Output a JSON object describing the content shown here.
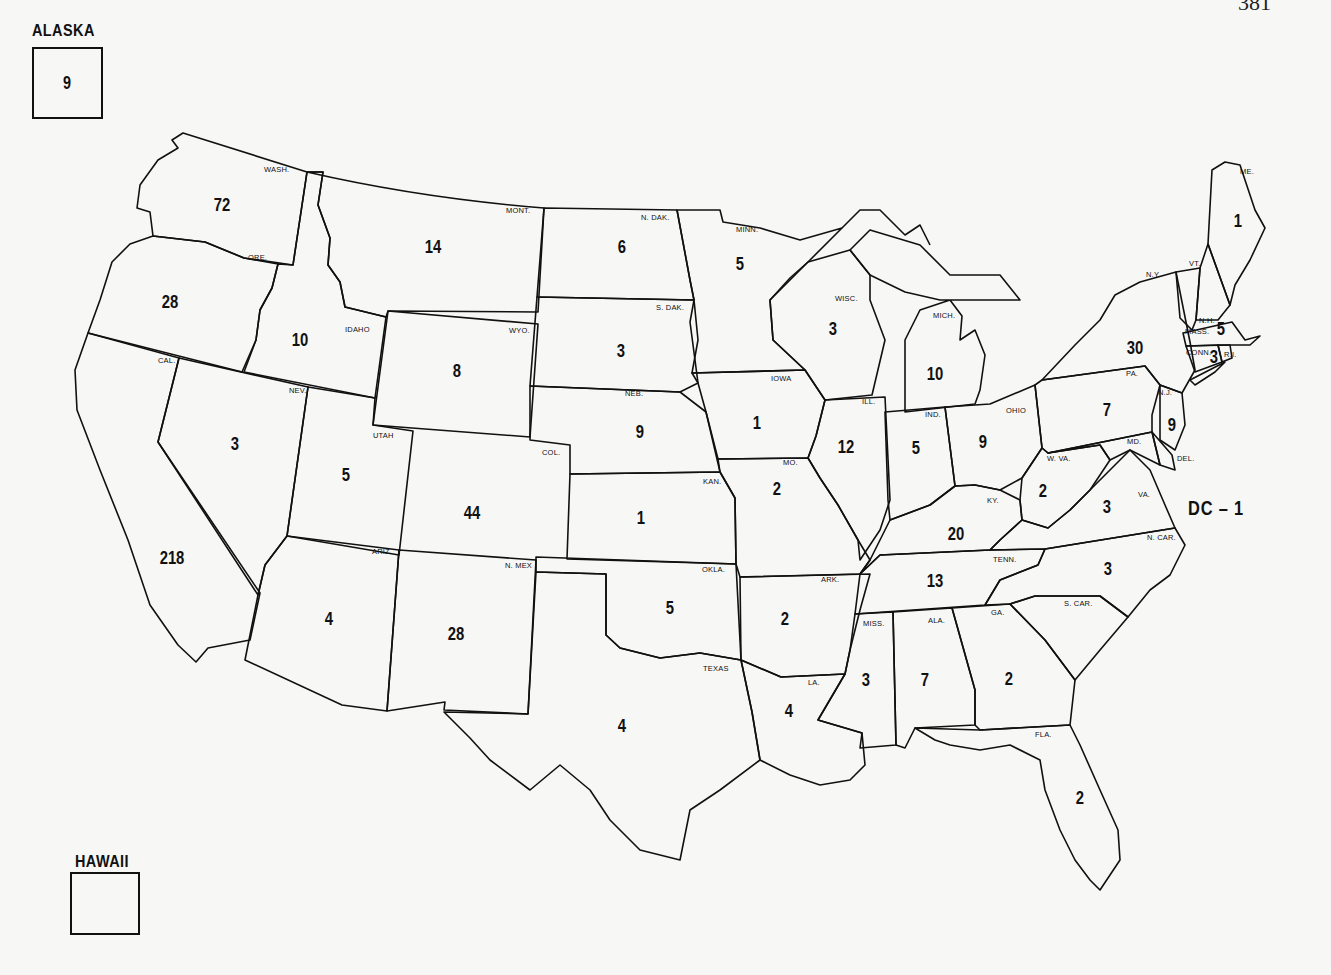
{
  "page": {
    "number": "381"
  },
  "insets": {
    "alaska": {
      "title": "ALASKA",
      "value": "9"
    },
    "hawaii": {
      "title": "HAWAII",
      "value": ""
    }
  },
  "dc": {
    "label": "DC – 1",
    "value": 1
  },
  "states": [
    {
      "abbr": "WASH.",
      "name": "Washington",
      "count": "72",
      "lx": 264,
      "ly": 166,
      "cx": 222,
      "cy": 204
    },
    {
      "abbr": "ORE.",
      "name": "Oregon",
      "count": "28",
      "lx": 248,
      "ly": 254,
      "cx": 170,
      "cy": 301
    },
    {
      "abbr": "CAL.",
      "name": "California",
      "count": "218",
      "lx": 158,
      "ly": 357,
      "cx": 172,
      "cy": 557
    },
    {
      "abbr": "IDAHO",
      "name": "Idaho",
      "count": "10",
      "lx": 345,
      "ly": 326,
      "cx": 300,
      "cy": 339
    },
    {
      "abbr": "NEV.",
      "name": "Nevada",
      "count": "3",
      "lx": 289,
      "ly": 387,
      "cx": 235,
      "cy": 443
    },
    {
      "abbr": "MONT.",
      "name": "Montana",
      "count": "14",
      "lx": 506,
      "ly": 207,
      "cx": 433,
      "cy": 246
    },
    {
      "abbr": "WYO.",
      "name": "Wyoming",
      "count": "8",
      "lx": 509,
      "ly": 327,
      "cx": 457,
      "cy": 370
    },
    {
      "abbr": "UTAH",
      "name": "Utah",
      "count": "5",
      "lx": 373,
      "ly": 432,
      "cx": 346,
      "cy": 474
    },
    {
      "abbr": "COL.",
      "name": "Colorado",
      "count": "44",
      "lx": 542,
      "ly": 449,
      "cx": 472,
      "cy": 512
    },
    {
      "abbr": "ARIZ.",
      "name": "Arizona",
      "count": "4",
      "lx": 372,
      "ly": 548,
      "cx": 329,
      "cy": 618
    },
    {
      "abbr": "N. MEX",
      "name": "New Mexico",
      "count": "28",
      "lx": 505,
      "ly": 562,
      "cx": 456,
      "cy": 633
    },
    {
      "abbr": "N. DAK.",
      "name": "North Dakota",
      "count": "6",
      "lx": 641,
      "ly": 214,
      "cx": 622,
      "cy": 246
    },
    {
      "abbr": "S. DAK.",
      "name": "South Dakota",
      "count": "3",
      "lx": 656,
      "ly": 304,
      "cx": 621,
      "cy": 350
    },
    {
      "abbr": "NEB.",
      "name": "Nebraska",
      "count": "9",
      "lx": 625,
      "ly": 390,
      "cx": 640,
      "cy": 431
    },
    {
      "abbr": "KAN.",
      "name": "Kansas",
      "count": "1",
      "lx": 703,
      "ly": 478,
      "cx": 641,
      "cy": 517
    },
    {
      "abbr": "OKLA.",
      "name": "Oklahoma",
      "count": "5",
      "lx": 702,
      "ly": 566,
      "cx": 670,
      "cy": 607
    },
    {
      "abbr": "TEXAS",
      "name": "Texas",
      "count": "4",
      "lx": 703,
      "ly": 665,
      "cx": 622,
      "cy": 725
    },
    {
      "abbr": "MINN.",
      "name": "Minnesota",
      "count": "5",
      "lx": 736,
      "ly": 226,
      "cx": 740,
      "cy": 263
    },
    {
      "abbr": "IOWA",
      "name": "Iowa",
      "count": "1",
      "lx": 771,
      "ly": 375,
      "cx": 757,
      "cy": 422
    },
    {
      "abbr": "MO.",
      "name": "Missouri",
      "count": "2",
      "lx": 783,
      "ly": 459,
      "cx": 777,
      "cy": 488
    },
    {
      "abbr": "ARK.",
      "name": "Arkansas",
      "count": "2",
      "lx": 821,
      "ly": 576,
      "cx": 785,
      "cy": 618
    },
    {
      "abbr": "LA.",
      "name": "Louisiana",
      "count": "4",
      "lx": 808,
      "ly": 679,
      "cx": 789,
      "cy": 710
    },
    {
      "abbr": "WISC.",
      "name": "Wisconsin",
      "count": "3",
      "lx": 835,
      "ly": 295,
      "cx": 833,
      "cy": 328
    },
    {
      "abbr": "ILL.",
      "name": "Illinois",
      "count": "12",
      "lx": 862,
      "ly": 398,
      "cx": 846,
      "cy": 446
    },
    {
      "abbr": "MICH.",
      "name": "Michigan",
      "count": "10",
      "lx": 933,
      "ly": 312,
      "cx": 935,
      "cy": 373
    },
    {
      "abbr": "IND.",
      "name": "Indiana",
      "count": "5",
      "lx": 925,
      "ly": 411,
      "cx": 916,
      "cy": 447
    },
    {
      "abbr": "OHIO",
      "name": "Ohio",
      "count": "9",
      "lx": 1006,
      "ly": 407,
      "cx": 983,
      "cy": 441
    },
    {
      "abbr": "KY.",
      "name": "Kentucky",
      "count": "20",
      "lx": 987,
      "ly": 497,
      "cx": 956,
      "cy": 533
    },
    {
      "abbr": "TENN.",
      "name": "Tennessee",
      "count": "13",
      "lx": 993,
      "ly": 556,
      "cx": 935,
      "cy": 580
    },
    {
      "abbr": "MISS.",
      "name": "Mississippi",
      "count": "3",
      "lx": 863,
      "ly": 620,
      "cx": 866,
      "cy": 679
    },
    {
      "abbr": "ALA.",
      "name": "Alabama",
      "count": "7",
      "lx": 928,
      "ly": 617,
      "cx": 925,
      "cy": 679
    },
    {
      "abbr": "GA.",
      "name": "Georgia",
      "count": "2",
      "lx": 991,
      "ly": 609,
      "cx": 1009,
      "cy": 678
    },
    {
      "abbr": "FLA.",
      "name": "Florida",
      "count": "2",
      "lx": 1035,
      "ly": 731,
      "cx": 1080,
      "cy": 797
    },
    {
      "abbr": "S. CAR.",
      "name": "South Carolina",
      "count": "",
      "lx": 1064,
      "ly": 600,
      "cx": null,
      "cy": null
    },
    {
      "abbr": "N. CAR.",
      "name": "North Carolina",
      "count": "3",
      "lx": 1147,
      "ly": 534,
      "cx": 1108,
      "cy": 568
    },
    {
      "abbr": "VA.",
      "name": "Virginia",
      "count": "3",
      "lx": 1138,
      "ly": 491,
      "cx": 1107,
      "cy": 506
    },
    {
      "abbr": "W. VA.",
      "name": "West Virginia",
      "count": "2",
      "lx": 1047,
      "ly": 455,
      "cx": 1043,
      "cy": 490
    },
    {
      "abbr": "MD.",
      "name": "Maryland",
      "count": "",
      "lx": 1127,
      "ly": 438,
      "cx": null,
      "cy": null
    },
    {
      "abbr": "DEL.",
      "name": "Delaware",
      "count": "",
      "lx": 1177,
      "ly": 455,
      "cx": null,
      "cy": null
    },
    {
      "abbr": "PA.",
      "name": "Pennsylvania",
      "count": "7",
      "lx": 1126,
      "ly": 370,
      "cx": 1107,
      "cy": 409
    },
    {
      "abbr": "N.J.",
      "name": "New Jersey",
      "count": "9",
      "lx": 1158,
      "ly": 389,
      "cx": 1172,
      "cy": 424
    },
    {
      "abbr": "N.Y.",
      "name": "New York",
      "count": "30",
      "lx": 1146,
      "ly": 271,
      "cx": 1135,
      "cy": 347
    },
    {
      "abbr": "VT.",
      "name": "Vermont",
      "count": "",
      "lx": 1189,
      "ly": 260,
      "cx": null,
      "cy": null
    },
    {
      "abbr": "N.H.",
      "name": "New Hampshire",
      "count": "",
      "lx": 1199,
      "ly": 317,
      "cx": null,
      "cy": null
    },
    {
      "abbr": "MASS.",
      "name": "Massachusetts",
      "count": "5",
      "lx": 1185,
      "ly": 328,
      "cx": 1221,
      "cy": 328
    },
    {
      "abbr": "CONN.",
      "name": "Connecticut",
      "count": "3",
      "lx": 1186,
      "ly": 349,
      "cx": 1214,
      "cy": 356
    },
    {
      "abbr": "R.I.",
      "name": "Rhode Island",
      "count": "",
      "lx": 1224,
      "ly": 351,
      "cx": null,
      "cy": null
    },
    {
      "abbr": "ME.",
      "name": "Maine",
      "count": "1",
      "lx": 1240,
      "ly": 168,
      "cx": 1238,
      "cy": 220
    }
  ],
  "total_visible": 744
}
